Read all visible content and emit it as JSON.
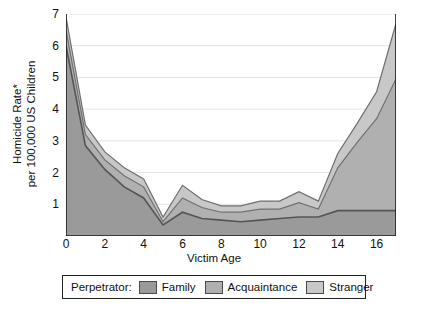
{
  "chart_data": {
    "type": "area",
    "stacked": true,
    "title": "",
    "xlabel": "Victim Age",
    "ylabel": "Homicide Rate*\nper 100,000 US Children",
    "ylabel_lines": [
      "Homicide Rate*",
      "per 100,000 US Children"
    ],
    "xlim": [
      0,
      17
    ],
    "ylim": [
      0,
      7
    ],
    "xticks": [
      0,
      2,
      4,
      6,
      8,
      10,
      12,
      14,
      16
    ],
    "xtick_labels": [
      "0",
      "2",
      "4",
      "6",
      "8",
      "10",
      "12",
      "14",
      "16"
    ],
    "yticks": [
      1,
      2,
      3,
      4,
      5,
      6,
      7
    ],
    "ytick_labels": [
      "1",
      "2",
      "3",
      "4",
      "5",
      "6",
      "7"
    ],
    "grid": "horizontal",
    "legend_position": "below-axes",
    "legend_title": "Perpetrator:",
    "x": [
      0,
      1,
      2,
      3,
      4,
      5,
      6,
      7,
      8,
      9,
      10,
      11,
      12,
      13,
      14,
      15,
      16,
      17
    ],
    "series": [
      {
        "name": "Family",
        "color": "#9a9a9a",
        "values": [
          6.0,
          2.85,
          2.1,
          1.55,
          1.2,
          0.35,
          0.75,
          0.55,
          0.5,
          0.45,
          0.5,
          0.55,
          0.6,
          0.6,
          0.8,
          0.8,
          0.8,
          0.8
        ]
      },
      {
        "name": "Acquaintance",
        "color": "#b0b0b0",
        "values": [
          0.5,
          0.35,
          0.3,
          0.35,
          0.35,
          0.1,
          0.45,
          0.35,
          0.25,
          0.3,
          0.35,
          0.3,
          0.45,
          0.25,
          1.35,
          2.15,
          2.9,
          4.15
        ]
      },
      {
        "name": "Stranger",
        "color": "#c8c8c8",
        "values": [
          0.4,
          0.3,
          0.25,
          0.25,
          0.25,
          0.15,
          0.4,
          0.25,
          0.2,
          0.2,
          0.25,
          0.25,
          0.35,
          0.25,
          0.45,
          0.6,
          0.85,
          1.75
        ]
      }
    ],
    "totals": [
      6.9,
      3.5,
      2.65,
      2.15,
      1.8,
      0.6,
      1.6,
      1.15,
      0.95,
      0.95,
      1.1,
      1.1,
      1.4,
      1.1,
      2.6,
      3.55,
      4.55,
      6.7
    ]
  },
  "legend": {
    "title": "Perpetrator:",
    "items": [
      {
        "label": "Family",
        "color": "#9a9a9a"
      },
      {
        "label": "Acquaintance",
        "color": "#b0b0b0"
      },
      {
        "label": "Stranger",
        "color": "#c8c8c8"
      }
    ]
  },
  "axes": {
    "x_title": "Victim Age",
    "y_title_line1": "Homicide Rate*",
    "y_title_line2": "per 100,000 US Children"
  },
  "colors": {
    "family": "#9a9a9a",
    "acquaintance": "#b0b0b0",
    "stranger": "#c8c8c8",
    "axis": "#1a1a1a",
    "grid": "#e4e4e4",
    "line": "#6f6f6f",
    "line_dark": "#555555"
  }
}
